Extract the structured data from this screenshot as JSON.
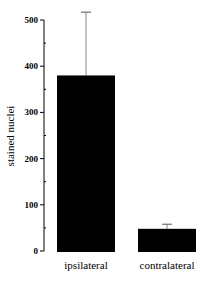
{
  "chart_data": {
    "type": "bar",
    "title": "",
    "xlabel": "",
    "ylabel": "stained nuclei",
    "ylim": [
      0,
      500
    ],
    "yticks": [
      0,
      100,
      200,
      300,
      400,
      500
    ],
    "categories": [
      "ipsilateral",
      "contralateral"
    ],
    "values": [
      380,
      48
    ],
    "error_upper": [
      137,
      10
    ],
    "grid": false,
    "legend": null,
    "bar_color": "#000000"
  }
}
